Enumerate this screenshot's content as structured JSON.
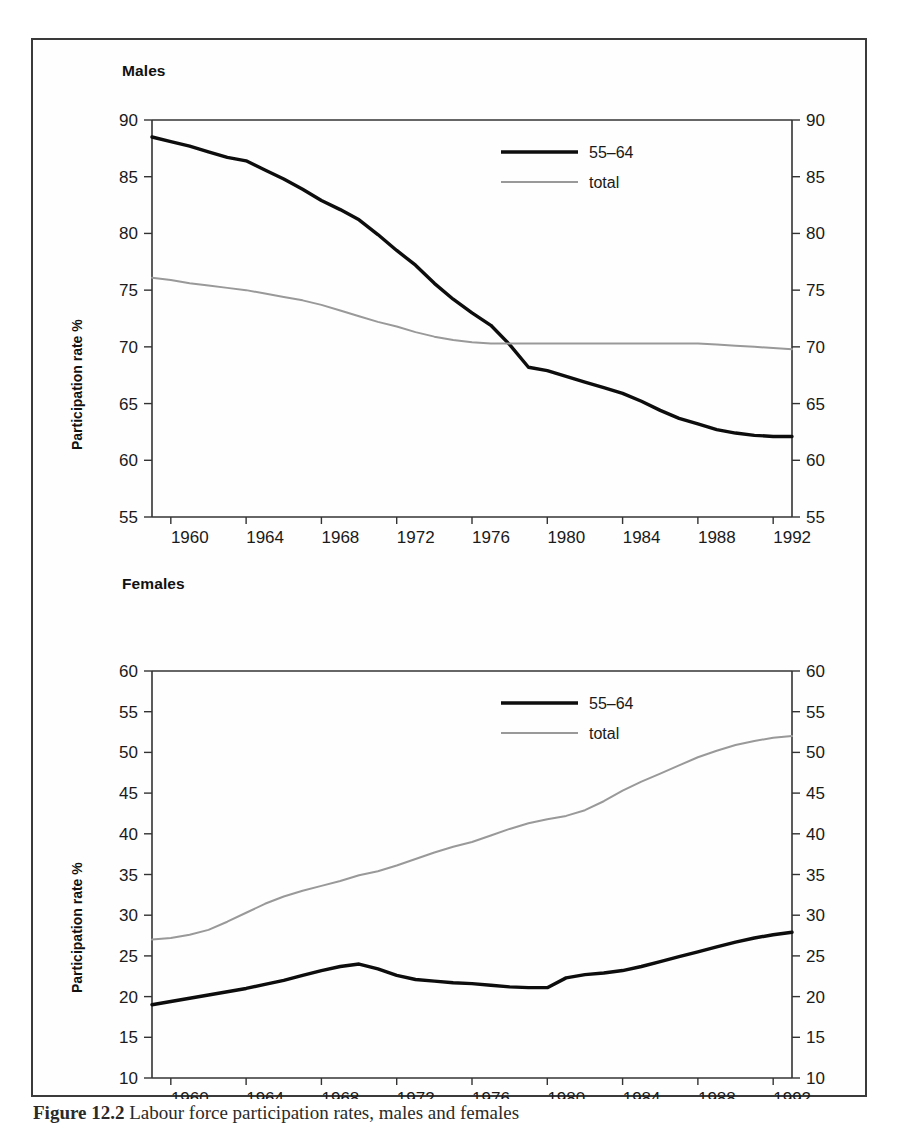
{
  "figure": {
    "caption_label": "Figure 12.2",
    "caption_text": "Labour force participation rates, males and females",
    "axis_label": "Participation rate %",
    "colors": {
      "series_55_64": "#0d0d0d",
      "series_total": "#999999",
      "axis": "#333333",
      "frame": "#3a3a3a"
    }
  },
  "panels": [
    {
      "title": "Males",
      "ylabel": "Participation rate %",
      "legend": [
        "55–64",
        "total"
      ],
      "yticks": [
        "90",
        "85",
        "80",
        "75",
        "70",
        "65",
        "60",
        "55"
      ],
      "xticks": [
        "1960",
        "1964",
        "1968",
        "1972",
        "1976",
        "1980",
        "1984",
        "1988",
        "1992"
      ]
    },
    {
      "title": "Females",
      "ylabel": "Participation rate %",
      "legend": [
        "55–64",
        "total"
      ],
      "yticks": [
        "60",
        "55",
        "50",
        "45",
        "40",
        "35",
        "30",
        "25",
        "20",
        "15",
        "10"
      ],
      "xticks": [
        "1960",
        "1964",
        "1968",
        "1972",
        "1976",
        "1980",
        "1984",
        "1988",
        "1992"
      ]
    }
  ],
  "chart_data": [
    {
      "type": "line",
      "title": "Males",
      "xlabel": "",
      "ylabel": "Participation rate %",
      "xlim": [
        1959,
        1993
      ],
      "ylim": [
        55,
        90
      ],
      "yticks": [
        55,
        60,
        65,
        70,
        75,
        80,
        85,
        90
      ],
      "xticks": [
        1960,
        1964,
        1968,
        1972,
        1976,
        1980,
        1984,
        1988,
        1992
      ],
      "grid": false,
      "legend_position": "top-right",
      "x": [
        1959,
        1960,
        1961,
        1962,
        1963,
        1964,
        1965,
        1966,
        1967,
        1968,
        1969,
        1970,
        1971,
        1972,
        1973,
        1974,
        1975,
        1976,
        1977,
        1978,
        1979,
        1980,
        1981,
        1982,
        1983,
        1984,
        1985,
        1986,
        1987,
        1988,
        1989,
        1990,
        1991,
        1992,
        1993
      ],
      "series": [
        {
          "name": "55–64",
          "color": "#0d0d0d",
          "values": [
            88.5,
            88.1,
            87.7,
            87.2,
            86.7,
            86.4,
            85.6,
            84.8,
            83.9,
            82.9,
            82.1,
            81.2,
            79.9,
            78.5,
            77.2,
            75.6,
            74.2,
            73.0,
            71.9,
            70.2,
            68.2,
            67.9,
            67.4,
            66.9,
            66.4,
            65.9,
            65.2,
            64.4,
            63.7,
            63.2,
            62.7,
            62.4,
            62.2,
            62.1,
            62.1
          ]
        },
        {
          "name": "total",
          "color": "#999999",
          "values": [
            76.1,
            75.9,
            75.6,
            75.4,
            75.2,
            75.0,
            74.7,
            74.4,
            74.1,
            73.7,
            73.2,
            72.7,
            72.2,
            71.8,
            71.3,
            70.9,
            70.6,
            70.4,
            70.3,
            70.3,
            70.3,
            70.3,
            70.3,
            70.3,
            70.3,
            70.3,
            70.3,
            70.3,
            70.3,
            70.3,
            70.2,
            70.1,
            70.0,
            69.9,
            69.8
          ]
        }
      ]
    },
    {
      "type": "line",
      "title": "Females",
      "xlabel": "",
      "ylabel": "Participation rate %",
      "xlim": [
        1959,
        1993
      ],
      "ylim": [
        10,
        60
      ],
      "yticks": [
        10,
        15,
        20,
        25,
        30,
        35,
        40,
        45,
        50,
        55,
        60
      ],
      "xticks": [
        1960,
        1964,
        1968,
        1972,
        1976,
        1980,
        1984,
        1988,
        1992
      ],
      "grid": false,
      "legend_position": "top-right",
      "x": [
        1959,
        1960,
        1961,
        1962,
        1963,
        1964,
        1965,
        1966,
        1967,
        1968,
        1969,
        1970,
        1971,
        1972,
        1973,
        1974,
        1975,
        1976,
        1977,
        1978,
        1979,
        1980,
        1981,
        1982,
        1983,
        1984,
        1985,
        1986,
        1987,
        1988,
        1989,
        1990,
        1991,
        1992,
        1993
      ],
      "series": [
        {
          "name": "55–64",
          "color": "#0d0d0d",
          "values": [
            19.0,
            19.4,
            19.8,
            20.2,
            20.6,
            21.0,
            21.5,
            22.0,
            22.6,
            23.2,
            23.7,
            24.0,
            23.4,
            22.6,
            22.1,
            21.9,
            21.7,
            21.6,
            21.4,
            21.2,
            21.1,
            21.1,
            22.3,
            22.7,
            22.9,
            23.2,
            23.7,
            24.3,
            24.9,
            25.5,
            26.1,
            26.7,
            27.2,
            27.6,
            27.9
          ]
        },
        {
          "name": "total",
          "color": "#999999",
          "values": [
            27.0,
            27.2,
            27.6,
            28.2,
            29.2,
            30.3,
            31.4,
            32.3,
            33.0,
            33.6,
            34.2,
            34.9,
            35.4,
            36.1,
            36.9,
            37.7,
            38.4,
            39.0,
            39.8,
            40.6,
            41.3,
            41.8,
            42.2,
            42.9,
            44.0,
            45.3,
            46.4,
            47.4,
            48.4,
            49.4,
            50.2,
            50.9,
            51.4,
            51.8,
            52.0
          ]
        }
      ]
    }
  ]
}
